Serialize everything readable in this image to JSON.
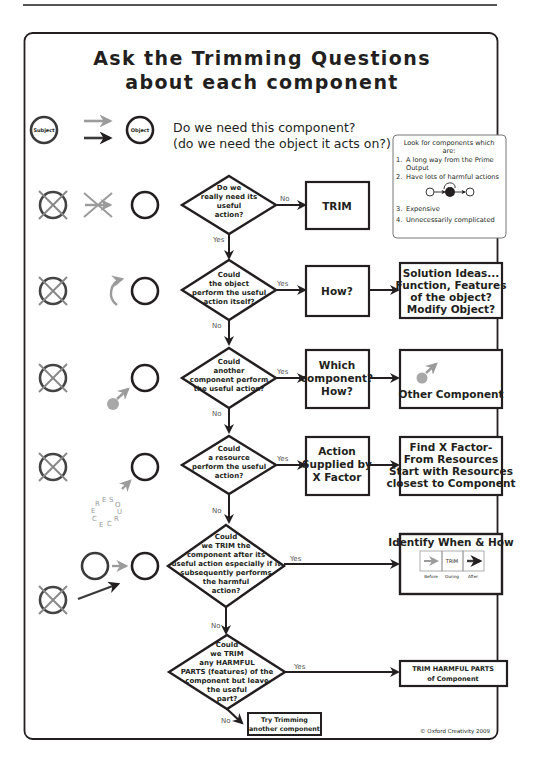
{
  "title": {
    "line1": "Ask the Trimming Questions",
    "line2": "about each component"
  },
  "intro": {
    "subject_label": "Subject",
    "object_label": "Object",
    "question_line1": "Do we need this component?",
    "question_line2": "(do we need the object it acts on?)"
  },
  "lookfor": {
    "header_line1": "Look for components which",
    "header_line2": "are:",
    "items": [
      {
        "num": "1.",
        "line1": "A long way from the Prime",
        "line2": "Output"
      },
      {
        "num": "2.",
        "line1": "Have lots of harmful actions",
        "line2": ""
      },
      {
        "num": "3.",
        "line1": "Expensive",
        "line2": ""
      },
      {
        "num": "4.",
        "line1": "Unnecessarily complicated",
        "line2": ""
      }
    ]
  },
  "flow": [
    {
      "question": [
        "Do we",
        "really need its",
        "useful",
        "action?"
      ],
      "branch_label": "No",
      "down_label": "Yes",
      "result": [
        "TRIM"
      ]
    },
    {
      "question": [
        "Could",
        "the object",
        "perform the useful",
        "action itself?"
      ],
      "branch_label": "Yes",
      "down_label": "No",
      "result": [
        "How?"
      ],
      "outcome": [
        "Solution Ideas...",
        "Function, Features",
        "of the object?",
        "Modify Object?"
      ]
    },
    {
      "question": [
        "Could",
        "another",
        "component perform",
        "the useful action?"
      ],
      "branch_label": "Yes",
      "down_label": "No",
      "result": [
        "Which",
        "component?",
        "How?"
      ],
      "outcome": [
        "Other Component"
      ]
    },
    {
      "question": [
        "Could",
        "a resource",
        "perform the useful",
        "action?"
      ],
      "branch_label": "Yes",
      "down_label": "No",
      "result": [
        "Action",
        "Supplied by",
        "X Factor"
      ],
      "outcome": [
        "Find X Factor-",
        "From Resources",
        "Start with Resources",
        "closest to Component"
      ]
    },
    {
      "question": [
        "Could",
        "we TRIM the",
        "component after its",
        "useful action especially if it",
        "subsequently performs",
        "the harmful",
        "action?"
      ],
      "branch_label": "Yes",
      "down_label": "No",
      "outcome_title": "Identify When & How",
      "timeline": {
        "during_label": "TRIM",
        "before": "Before",
        "during": "During",
        "after": "After"
      }
    },
    {
      "question": [
        "Could",
        "we TRIM",
        "any HARMFUL",
        "PARTS (features) of the",
        "component but leave",
        "the useful",
        "part?"
      ],
      "branch_label": "Yes",
      "down_label": "No",
      "outcome": [
        "TRIM HARMFUL PARTS",
        "of Component"
      ],
      "final": [
        "Try Trimming",
        "another component"
      ]
    }
  ],
  "resource_text": "RESOURCE",
  "copyright": "© Oxford Creativity 2009",
  "colors": {
    "ink": "#231f20",
    "grey": "#9b9b9b",
    "grey_dot": "#a8a8a8"
  }
}
